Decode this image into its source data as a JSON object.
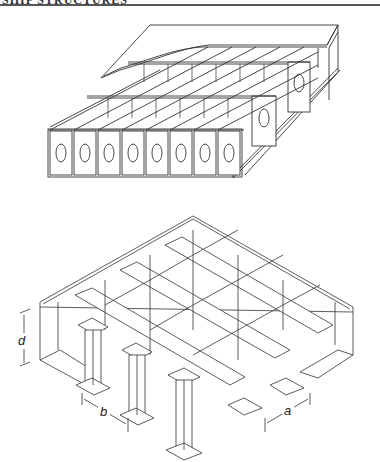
{
  "page": {
    "header": {
      "text": "SHIP STRUCTURES",
      "clipped": true
    },
    "colors": {
      "line": "#333333",
      "background": "#ffffff"
    }
  },
  "figures": [
    {
      "id": "stiffened-panel",
      "description": "Isometric view of a double-skin stiffened panel with longitudinal girders and transverse floors containing oval lightening holes",
      "cell_count_front_row": 8,
      "hole_shape": "oval"
    },
    {
      "id": "grillage",
      "description": "Isometric view of an orthogonally stiffened plate grillage with T-section beams",
      "dimension_labels": {
        "depth": "d",
        "spacing_b": "b",
        "spacing_a": "a"
      }
    }
  ]
}
